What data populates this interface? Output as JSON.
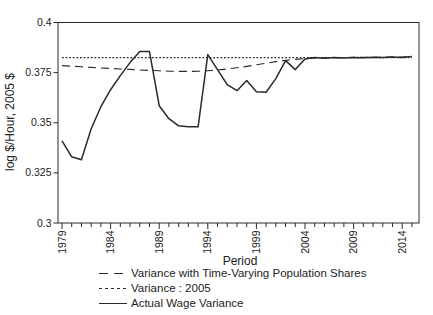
{
  "figure": {
    "background_color": "#ffffff",
    "line_color": "#2a2a2a",
    "text_color": "#222222"
  },
  "chart_data": {
    "type": "line",
    "title": "",
    "xlabel": "Period",
    "ylabel": "log $/Hour, 2005 $",
    "xlim": [
      1978.6,
      2015.7
    ],
    "ylim": [
      0.3,
      0.4
    ],
    "grid": false,
    "legend_position": "bottom-left",
    "y_ticks": [
      0.4,
      0.375,
      0.35,
      0.325,
      0.3
    ],
    "y_tick_labels": [
      "0.4",
      "0.375",
      "0.35",
      "0.325",
      "0.3"
    ],
    "x_ticks_labeled": [
      1979,
      1984,
      1989,
      1994,
      1999,
      2004,
      2009,
      2014
    ],
    "x_tick_minor_interval_years": 1,
    "x": [
      1979,
      1980,
      1981,
      1982,
      1983,
      1984,
      1985,
      1986,
      1987,
      1988,
      1989,
      1990,
      1991,
      1992,
      1993,
      1994,
      1995,
      1996,
      1997,
      1998,
      1999,
      2000,
      2001,
      2002,
      2003,
      2004,
      2005,
      2006,
      2007,
      2008,
      2009,
      2010,
      2011,
      2012,
      2013,
      2014,
      2015
    ],
    "series": [
      {
        "name": "Variance with Time-Varying Population Shares",
        "style": "dashed",
        "values": [
          0.3785,
          0.3782,
          0.3779,
          0.3776,
          0.3773,
          0.3771,
          0.3768,
          0.3766,
          0.3763,
          0.3761,
          0.3759,
          0.3757,
          0.3756,
          0.3756,
          0.3757,
          0.3759,
          0.3763,
          0.3768,
          0.3774,
          0.3781,
          0.3789,
          0.3797,
          0.3805,
          0.3811,
          0.3816,
          0.382,
          0.3823,
          0.3824,
          0.3825,
          0.3825,
          0.3826,
          0.3826,
          0.3827,
          0.3827,
          0.3828,
          0.3828,
          0.3829
        ]
      },
      {
        "name": "Variance : 2005",
        "style": "dotted",
        "values": [
          0.3825,
          0.3825,
          0.3825,
          0.3825,
          0.3825,
          0.3825,
          0.3825,
          0.3825,
          0.3825,
          0.3825,
          0.3825,
          0.3825,
          0.3825,
          0.3825,
          0.3825,
          0.3825,
          0.3825,
          0.3825,
          0.3825,
          0.3825,
          0.3825,
          0.3825,
          0.3825,
          0.3825,
          0.3825,
          0.3825,
          0.3825,
          0.3825,
          0.3825,
          0.3825,
          0.3825,
          0.3825,
          0.3825,
          0.3825,
          0.3825,
          0.3825,
          0.3825
        ]
      },
      {
        "name": "Actual Wage Variance",
        "style": "solid",
        "values": [
          0.341,
          0.333,
          0.3315,
          0.347,
          0.358,
          0.3665,
          0.3735,
          0.38,
          0.3855,
          0.3855,
          0.3585,
          0.352,
          0.3485,
          0.348,
          0.348,
          0.384,
          0.3765,
          0.369,
          0.366,
          0.371,
          0.3655,
          0.3652,
          0.372,
          0.381,
          0.3765,
          0.3818,
          0.3825,
          0.3822,
          0.3826,
          0.3823,
          0.3826,
          0.3824,
          0.3827,
          0.3825,
          0.3828,
          0.3826,
          0.383
        ]
      }
    ]
  }
}
